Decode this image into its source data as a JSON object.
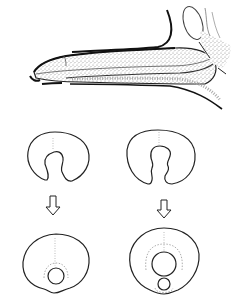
{
  "figure": {
    "background": "#ffffff",
    "ink": "#222222",
    "stipple": "#bdbdbd",
    "top_panel": {
      "name": "longitudinal-section"
    },
    "bottom_panel": {
      "columns": [
        {
          "name": "left-sequence",
          "stages": [
            "open-section",
            "closed-section"
          ],
          "arrow": "down"
        },
        {
          "name": "right-sequence",
          "stages": [
            "open-section-notched",
            "closed-section-double"
          ],
          "arrow": "down"
        }
      ]
    }
  }
}
